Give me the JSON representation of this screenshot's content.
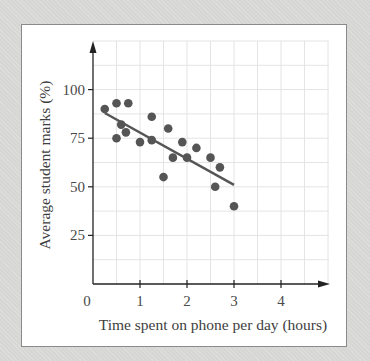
{
  "chart_data": {
    "type": "scatter",
    "title": "",
    "xlabel": "Time spent on phone per day (hours)",
    "ylabel": "Average student marks (%)",
    "xlim": [
      0,
      5
    ],
    "ylim": [
      0,
      115
    ],
    "x_ticks": [
      0,
      1,
      2,
      3,
      4
    ],
    "y_ticks": [
      25,
      50,
      75,
      100
    ],
    "x_tick_labels": [
      "0",
      "1",
      "2",
      "3",
      "4"
    ],
    "y_tick_labels": [
      "25",
      "50",
      "75",
      "100"
    ],
    "grid": true,
    "legend": null,
    "series": [
      {
        "name": "Students",
        "points": [
          {
            "x": 0.25,
            "y": 90
          },
          {
            "x": 0.5,
            "y": 93
          },
          {
            "x": 0.75,
            "y": 93
          },
          {
            "x": 0.6,
            "y": 82
          },
          {
            "x": 0.7,
            "y": 78
          },
          {
            "x": 0.5,
            "y": 75
          },
          {
            "x": 1.0,
            "y": 73
          },
          {
            "x": 1.25,
            "y": 86
          },
          {
            "x": 1.25,
            "y": 74
          },
          {
            "x": 1.5,
            "y": 55
          },
          {
            "x": 1.6,
            "y": 80
          },
          {
            "x": 1.7,
            "y": 65
          },
          {
            "x": 1.9,
            "y": 73
          },
          {
            "x": 2.0,
            "y": 65
          },
          {
            "x": 2.2,
            "y": 70
          },
          {
            "x": 2.5,
            "y": 65
          },
          {
            "x": 2.6,
            "y": 50
          },
          {
            "x": 2.7,
            "y": 60
          },
          {
            "x": 3.0,
            "y": 40
          }
        ]
      }
    ],
    "trend_line": {
      "x1": 0.25,
      "y1": 88,
      "x2": 3.0,
      "y2": 51
    },
    "colors": {
      "points": "#555555",
      "trend_line": "#555555",
      "axes": "#222222",
      "grid": "#e4e4e4",
      "frame_bg": "#d6d6d4",
      "panel_bg": "#ffffff"
    }
  }
}
